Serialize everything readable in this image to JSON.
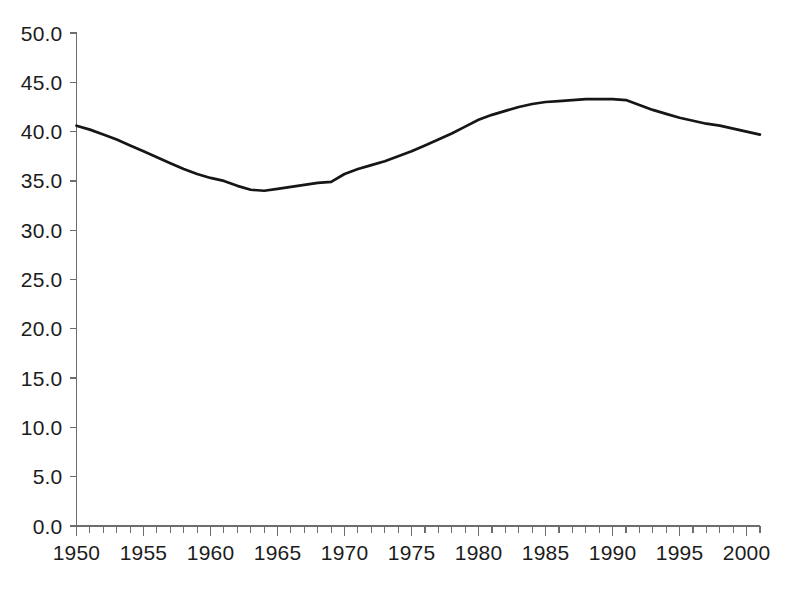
{
  "chart_data": {
    "type": "line",
    "title": "",
    "subtitle": "",
    "xlabel": "",
    "ylabel": "",
    "xlim": [
      1950,
      2001
    ],
    "ylim": [
      0.0,
      50.0
    ],
    "grid": false,
    "legend": false,
    "legend_position": "none",
    "line_color": "#161616",
    "background_color": "#ffffff",
    "axis_color": "#6d6d6d",
    "y_ticks": [
      0.0,
      5.0,
      10.0,
      15.0,
      20.0,
      25.0,
      30.0,
      35.0,
      40.0,
      45.0,
      50.0
    ],
    "y_tick_labels": [
      "0.0",
      "5.0",
      "10.0",
      "15.0",
      "20.0",
      "25.0",
      "30.0",
      "35.0",
      "40.0",
      "45.0",
      "50.0"
    ],
    "x_ticks": [
      1950,
      1955,
      1960,
      1965,
      1970,
      1975,
      1980,
      1985,
      1990,
      1995,
      2000
    ],
    "x_tick_labels": [
      "1950",
      "1955",
      "1960",
      "1965",
      "1970",
      "1975",
      "1980",
      "1985",
      "1990",
      "1995",
      "2000"
    ],
    "x_minor_tick_interval": 1,
    "series": [
      {
        "name": "value",
        "x": [
          1950,
          1951,
          1952,
          1953,
          1954,
          1955,
          1956,
          1957,
          1958,
          1959,
          1960,
          1961,
          1962,
          1963,
          1964,
          1965,
          1966,
          1967,
          1968,
          1969,
          1970,
          1971,
          1972,
          1973,
          1974,
          1975,
          1976,
          1977,
          1978,
          1979,
          1980,
          1981,
          1982,
          1983,
          1984,
          1985,
          1986,
          1987,
          1988,
          1989,
          1990,
          1991,
          1992,
          1993,
          1994,
          1995,
          1996,
          1997,
          1998,
          1999,
          2000,
          2001
        ],
        "values": [
          40.6,
          40.2,
          39.7,
          39.2,
          38.6,
          38.0,
          37.4,
          36.8,
          36.2,
          35.7,
          35.3,
          35.0,
          34.5,
          34.1,
          34.0,
          34.2,
          34.4,
          34.6,
          34.8,
          34.9,
          35.7,
          36.2,
          36.6,
          37.0,
          37.5,
          38.0,
          38.6,
          39.2,
          39.8,
          40.5,
          41.2,
          41.7,
          42.1,
          42.5,
          42.8,
          43.0,
          43.1,
          43.2,
          43.3,
          43.3,
          43.3,
          43.2,
          42.7,
          42.2,
          41.8,
          41.4,
          41.1,
          40.8,
          40.6,
          40.3,
          40.0,
          39.7
        ]
      }
    ]
  },
  "axis": {
    "y_axis_name": "y-axis",
    "x_axis_name": "x-axis"
  }
}
